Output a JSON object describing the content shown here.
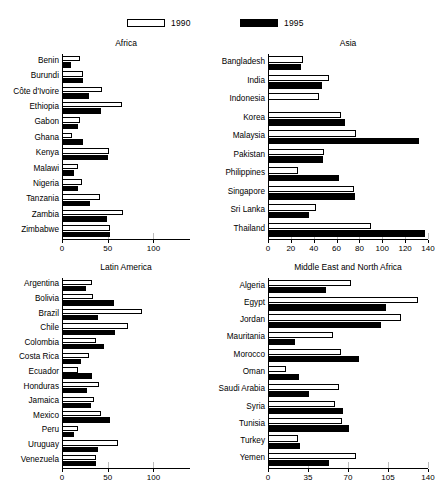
{
  "legend": {
    "items": [
      {
        "label": "1990",
        "style": "open",
        "color": "#ffffff"
      },
      {
        "label": "1995",
        "style": "solid",
        "color": "#000000"
      }
    ]
  },
  "chart_data": [
    {
      "type": "bar",
      "title": "Africa",
      "orientation": "horizontal",
      "xlabel": "",
      "ylabel": "",
      "xlim": [
        0,
        140
      ],
      "ticks": [
        0,
        50,
        100
      ],
      "grid": false,
      "legend_position": "top",
      "categories": [
        "Benin",
        "Burundi",
        "Côte d'Ivoire",
        "Ethiopia",
        "Gabon",
        "Ghana",
        "Kenya",
        "Malawi",
        "Nigeria",
        "Tanzania",
        "Zambia",
        "Zimbabwe"
      ],
      "series": [
        {
          "name": "1990",
          "values": [
            20,
            23,
            44,
            66,
            20,
            11,
            51,
            18,
            22,
            42,
            67,
            52
          ]
        },
        {
          "name": "1995",
          "values": [
            10,
            23,
            29,
            43,
            17,
            23,
            50,
            13,
            17,
            31,
            49,
            53
          ]
        }
      ]
    },
    {
      "type": "bar",
      "title": "Asia",
      "orientation": "horizontal",
      "xlabel": "",
      "ylabel": "",
      "xlim": [
        0,
        140
      ],
      "ticks": [
        0,
        20,
        40,
        60,
        80,
        100,
        120,
        140
      ],
      "grid": false,
      "legend_position": "top",
      "categories": [
        "Bangladesh",
        "India",
        "Indonesia",
        "Korea",
        "Malaysia",
        "Pakistan",
        "Philippines",
        "Singapore",
        "Sri Lanka",
        "Thailand"
      ],
      "series": [
        {
          "name": "1990",
          "values": [
            31,
            53,
            45,
            64,
            77,
            49,
            26,
            75,
            42,
            90
          ]
        },
        {
          "name": "1995",
          "values": [
            29,
            47,
            0,
            67,
            132,
            48,
            62,
            76,
            36,
            137
          ]
        }
      ]
    },
    {
      "type": "bar",
      "title": "Latin America",
      "orientation": "horizontal",
      "xlabel": "",
      "ylabel": "",
      "xlim": [
        0,
        140
      ],
      "ticks": [
        0,
        50,
        100
      ],
      "grid": false,
      "legend_position": "top",
      "categories": [
        "Argentina",
        "Bolivia",
        "Brazil",
        "Chile",
        "Colombia",
        "Costa Rica",
        "Ecuador",
        "Honduras",
        "Jamaica",
        "Mexico",
        "Peru",
        "Uruguay",
        "Venezuela"
      ],
      "series": [
        {
          "name": "1990",
          "values": [
            33,
            34,
            87,
            72,
            37,
            29,
            17,
            41,
            35,
            43,
            17,
            61,
            37
          ]
        },
        {
          "name": "1995",
          "values": [
            26,
            57,
            39,
            58,
            46,
            21,
            33,
            27,
            32,
            53,
            13,
            39,
            37
          ]
        }
      ]
    },
    {
      "type": "bar",
      "title": "Middle East and North Africa",
      "orientation": "horizontal",
      "xlabel": "",
      "ylabel": "",
      "xlim": [
        0,
        140
      ],
      "ticks": [
        0,
        35,
        70,
        105,
        140
      ],
      "grid": false,
      "legend_position": "top",
      "categories": [
        "Algeria",
        "Egypt",
        "Jordan",
        "Mauritania",
        "Morocco",
        "Oman",
        "Saudi Arabia",
        "Syria",
        "Tunisia",
        "Turkey",
        "Yemen"
      ],
      "series": [
        {
          "name": "1990",
          "values": [
            73,
            131,
            116,
            57,
            64,
            16,
            62,
            59,
            65,
            26,
            77
          ]
        },
        {
          "name": "1995",
          "values": [
            51,
            103,
            99,
            24,
            80,
            27,
            36,
            66,
            71,
            28,
            53
          ]
        }
      ]
    }
  ]
}
